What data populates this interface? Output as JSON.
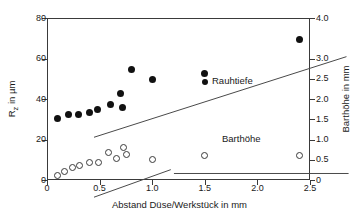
{
  "chart_data": {
    "type": "scatter",
    "title": "",
    "xlabel": "Abstand Düse/Werkstück in mm",
    "ylabel": "R_z in µm",
    "ylabel_right": "Barthöhe in mm",
    "xlim": [
      0,
      2.5
    ],
    "ylim": [
      0,
      80
    ],
    "ylim_right": [
      0,
      4.0
    ],
    "grid": false,
    "legend_position": "inline-annotation",
    "xticks": [
      0,
      0.5,
      1.0,
      1.5,
      2.0,
      2.5
    ],
    "xticklabels": [
      "0",
      "0.5",
      "1.0",
      "1.5",
      "2.0",
      "2.5"
    ],
    "yticks": [
      0,
      20,
      40,
      60,
      80
    ],
    "yticklabels": [
      "0",
      "20",
      "40",
      "60",
      "80"
    ],
    "yticks_right": [
      0,
      0.5,
      1.0,
      1.5,
      2.0,
      2.5,
      3.0,
      4.0
    ],
    "yticklabels_right": [
      "0",
      "0.5",
      "1.0",
      "1.5",
      "2.0",
      "2.5",
      "3.0",
      "4.0"
    ],
    "series": [
      {
        "name": "Rauhtiefe",
        "marker": "filled-circle",
        "axis": "left",
        "unit": "µm",
        "points": [
          {
            "x": 0.1,
            "y": 30.3
          },
          {
            "x": 0.2,
            "y": 32.4
          },
          {
            "x": 0.3,
            "y": 32.2
          },
          {
            "x": 0.4,
            "y": 33.4
          },
          {
            "x": 0.48,
            "y": 34.8
          },
          {
            "x": 0.6,
            "y": 37.5
          },
          {
            "x": 0.7,
            "y": 42.6
          },
          {
            "x": 0.72,
            "y": 35.9
          },
          {
            "x": 0.8,
            "y": 54.8
          },
          {
            "x": 1.0,
            "y": 49.6
          },
          {
            "x": 1.5,
            "y": 52.5
          },
          {
            "x": 2.4,
            "y": 69.6
          }
        ],
        "fit_line": {
          "x0": 0.0,
          "y0": 30.0,
          "x1": 2.4,
          "y1": 69.8
        }
      },
      {
        "name": "Barthöhe",
        "marker": "open-circle",
        "axis": "right",
        "unit": "mm",
        "points": [
          {
            "x": 0.1,
            "y": 2.3
          },
          {
            "x": 0.17,
            "y": 4.4
          },
          {
            "x": 0.24,
            "y": 6.2
          },
          {
            "x": 0.31,
            "y": 7.2
          },
          {
            "x": 0.4,
            "y": 8.4
          },
          {
            "x": 0.49,
            "y": 8.6
          },
          {
            "x": 0.58,
            "y": 13.4
          },
          {
            "x": 0.66,
            "y": 10.7
          },
          {
            "x": 0.73,
            "y": 15.9
          },
          {
            "x": 0.76,
            "y": 12.8
          },
          {
            "x": 1.0,
            "y": 9.9
          },
          {
            "x": 1.5,
            "y": 12.0
          },
          {
            "x": 2.4,
            "y": 12.0
          }
        ],
        "rise_line": {
          "x0": 0.0,
          "y0": 0.4,
          "x1": 0.73,
          "y1": 14.0
        },
        "plateau_line": {
          "x0": 0.76,
          "y0": 12.1,
          "x1": 2.42,
          "y1": 12.1
        }
      }
    ],
    "annotations": [
      {
        "text": "Rauhtiefe",
        "x": 1.6,
        "y": 52.0
      },
      {
        "text": "Barthöhe",
        "x": 1.7,
        "y": 22.5
      }
    ],
    "colors": {
      "axis": "#3a3a3a",
      "marker_filled": "#111111",
      "marker_open_edge": "#3a3a3a",
      "marker_open_fill": "#ffffff",
      "line": "#4a4a4a",
      "text": "#1a1a1a",
      "background": "#ffffff"
    }
  },
  "axes": {
    "left": {
      "title_prefix": "R",
      "title_sub": "z",
      "title_suffix": " in µm",
      "ticks": [
        {
          "value": 0,
          "label": "0"
        },
        {
          "value": 20,
          "label": "20"
        },
        {
          "value": 40,
          "label": "40"
        },
        {
          "value": 60,
          "label": "60"
        },
        {
          "value": 80,
          "label": "80"
        }
      ]
    },
    "right": {
      "title": "Barthöhe in mm",
      "ticks": [
        {
          "value": 0,
          "label": "0"
        },
        {
          "value": 0.5,
          "label": "0.5"
        },
        {
          "value": 1.0,
          "label": "1.0"
        },
        {
          "value": 1.5,
          "label": "1.5"
        },
        {
          "value": 2.0,
          "label": "2.0"
        },
        {
          "value": 2.5,
          "label": "2.5"
        },
        {
          "value": 3.0,
          "label": "3.0"
        },
        {
          "value": 4.0,
          "label": "4.0"
        }
      ]
    },
    "bottom": {
      "title": "Abstand Düse/Werkstück in mm",
      "ticks": [
        {
          "value": 0,
          "label": "0"
        },
        {
          "value": 0.5,
          "label": "0.5"
        },
        {
          "value": 1.0,
          "label": "1.0"
        },
        {
          "value": 1.5,
          "label": "1.5"
        },
        {
          "value": 2.0,
          "label": "2.0"
        },
        {
          "value": 2.5,
          "label": "2.5"
        }
      ]
    }
  },
  "labels": {
    "rauhtiefe": "Rauhtiefe",
    "barthoehe": "Barthöhe"
  }
}
